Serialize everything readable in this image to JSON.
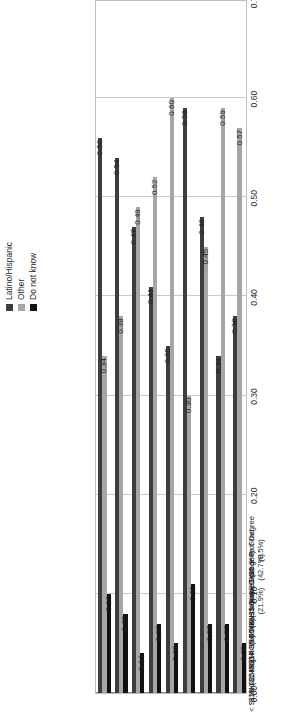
{
  "chart_data": {
    "type": "bar",
    "orientation": "horizontal-rotated",
    "title": "",
    "xlabel": "",
    "ylabel": "",
    "ylim": [
      0.0,
      0.7
    ],
    "axis_ticks": [
      "0.00",
      "0.10",
      "0.20",
      "0.30",
      "0.40",
      "0.50",
      "0.60",
      "0.70"
    ],
    "axis_tick_values": [
      0.0,
      0.1,
      0.2,
      0.3,
      0.4,
      0.5,
      0.6,
      0.7
    ],
    "grid": true,
    "legend_position": "top-right",
    "categories": [
      "< $15K (11.1%)",
      "$15K-$24K (17.9%)",
      "$25K-$34K (16.9%)",
      "$35K-$54K (23.1%)",
      "> $54K (31.0%)",
      "None to some HS (21.9%)",
      "HS or GED (25.9%)",
      "Some College to Grad (42.7%)",
      "Grad or Prof Degree (9.5%)"
    ],
    "series": [
      {
        "name": "Latino/Hispanic",
        "color": "#3d3d3d",
        "values": [
          0.56,
          0.54,
          0.47,
          0.41,
          0.35,
          0.59,
          0.48,
          0.34,
          0.38
        ],
        "labels": [
          "0.56",
          "0.54",
          "0.47",
          "0.41",
          "0.35",
          "0.59",
          "0.48",
          "0.34",
          "0.38"
        ]
      },
      {
        "name": "Other",
        "color": "#a6a6a6",
        "values": [
          0.34,
          0.38,
          0.49,
          0.52,
          0.6,
          0.3,
          0.45,
          0.59,
          0.57
        ],
        "labels": [
          "0.34",
          "0.38",
          "0.49",
          "0.52",
          "0.60",
          "0.30",
          "0.45",
          "0.59",
          "0.57"
        ]
      },
      {
        "name": "Do not know",
        "color": "#111111",
        "values": [
          0.1,
          0.08,
          0.04,
          0.07,
          0.05,
          0.11,
          0.07,
          0.07,
          0.05
        ],
        "labels": [
          "0.10",
          "0.08",
          "0.04",
          "0.07",
          "0.05",
          "0.11",
          "0.07",
          "0.07",
          "0.05"
        ]
      }
    ]
  },
  "legend": {
    "items": [
      {
        "label": "Latino/Hispanic",
        "color": "#3d3d3d"
      },
      {
        "label": "Other",
        "color": "#a6a6a6"
      },
      {
        "label": "Do not know",
        "color": "#111111"
      }
    ]
  }
}
